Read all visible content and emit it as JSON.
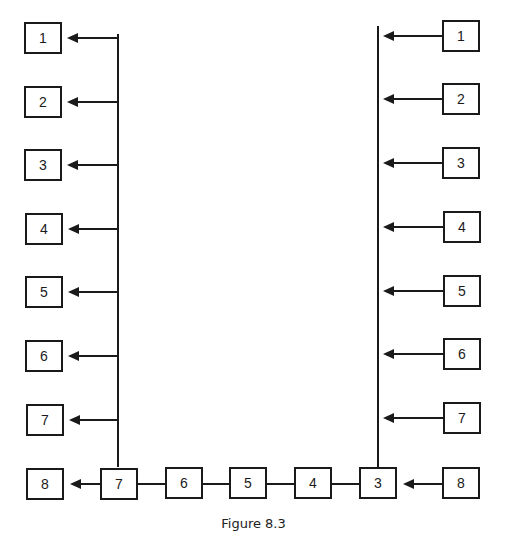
{
  "figure": {
    "caption": "Figure 8.3",
    "stroke_color": "#1a1a1a",
    "background": "#ffffff"
  },
  "left_column": {
    "boxes": [
      {
        "label": "1",
        "x": 24,
        "y": 22
      },
      {
        "label": "2",
        "x": 24,
        "y": 86
      },
      {
        "label": "3",
        "x": 24,
        "y": 149
      },
      {
        "label": "4",
        "x": 25,
        "y": 213
      },
      {
        "label": "5",
        "x": 25,
        "y": 276
      },
      {
        "label": "6",
        "x": 25,
        "y": 340
      },
      {
        "label": "7",
        "x": 26,
        "y": 404
      }
    ],
    "bus_x": 118,
    "bus_top": 34,
    "bus_bottom": 467
  },
  "right_column": {
    "boxes": [
      {
        "label": "1",
        "x": 442,
        "y": 20
      },
      {
        "label": "2",
        "x": 442,
        "y": 83
      },
      {
        "label": "3",
        "x": 442,
        "y": 147
      },
      {
        "label": "4",
        "x": 443,
        "y": 211
      },
      {
        "label": "5",
        "x": 443,
        "y": 275
      },
      {
        "label": "6",
        "x": 443,
        "y": 338
      },
      {
        "label": "7",
        "x": 443,
        "y": 402
      }
    ],
    "bus_x": 378,
    "bus_top": 26,
    "bus_bottom": 467
  },
  "bottom_row": {
    "boxes": [
      {
        "label": "8",
        "x": 26,
        "y": 468,
        "role": "left-output"
      },
      {
        "label": "7",
        "x": 100,
        "y": 468
      },
      {
        "label": "6",
        "x": 165,
        "y": 467
      },
      {
        "label": "5",
        "x": 229,
        "y": 467
      },
      {
        "label": "4",
        "x": 294,
        "y": 467
      },
      {
        "label": "3",
        "x": 359,
        "y": 467
      },
      {
        "label": "8",
        "x": 442,
        "y": 467,
        "role": "right-input"
      }
    ]
  }
}
